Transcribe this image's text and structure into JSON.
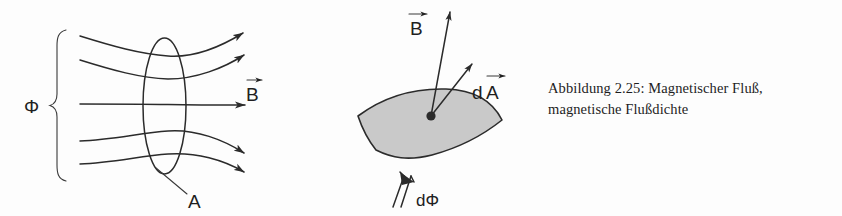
{
  "figure": {
    "caption_line1": "Abbildung 2.25: Magnetischer Fluß,",
    "caption_line2": "magnetische Flußdichte",
    "caption_full": "Abbildung 2.25: Magnetischer Fluß, magnetische Flußdichte",
    "figure_number": "2.25"
  },
  "left_diagram": {
    "flux_label": "Φ",
    "area_label": "A",
    "field_label": "B",
    "field_label_has_vector_arrow": true,
    "brace_icon": "curly-brace-icon",
    "field_line_count": 5,
    "arrow_icon": "arrowhead-icon",
    "ellipse_icon": "ellipse-area-icon"
  },
  "right_diagram": {
    "b_label": "B",
    "b_label_has_vector_arrow": true,
    "da_label_d": "d",
    "da_label_a": "A",
    "da_label": "dA",
    "da_label_has_vector_arrow": true,
    "dphi_label": "dΦ",
    "dphi_arrow_icon": "double-line-up-arrow-icon",
    "surface_icon": "curved-surface-patch-icon",
    "point_icon": "surface-point-dot-icon"
  },
  "colors": {
    "background": "#fdfdfd",
    "ink": "#2b2b2b",
    "surface_gray": "#c9c9c9",
    "text": "#1d1d1d"
  }
}
